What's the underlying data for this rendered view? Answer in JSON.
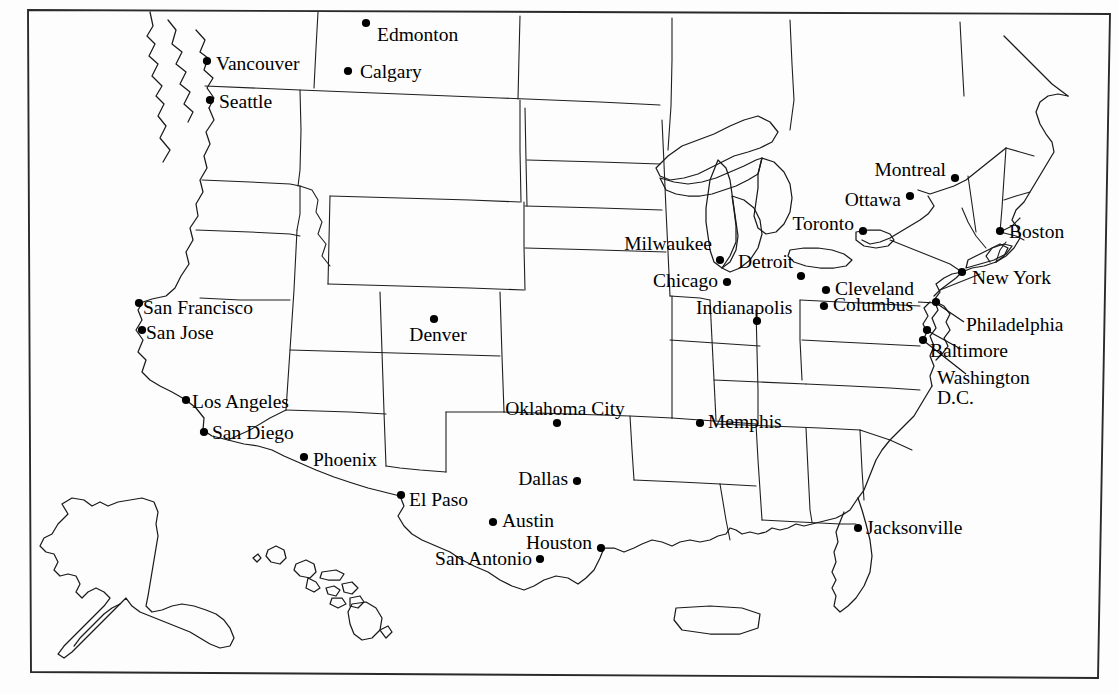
{
  "map": {
    "title": "United States and Canada city reference map",
    "background_color": "#fdfdfd",
    "line_color": "#1a1a1a",
    "dot_color": "#000000",
    "frame": {
      "x1": 28,
      "y1": 10,
      "x2": 1098,
      "y2": 678
    },
    "insets": [
      "alaska",
      "hawaii",
      "puerto-rico"
    ],
    "cities": [
      {
        "name": "Edmonton",
        "label": "Edmonton",
        "dot_x": 366,
        "dot_y": 23,
        "label_x": 377,
        "label_y": 35,
        "anchor": "start"
      },
      {
        "name": "Calgary",
        "label": "Calgary",
        "dot_x": 348,
        "dot_y": 71,
        "label_x": 360,
        "label_y": 72,
        "anchor": "start"
      },
      {
        "name": "Vancouver",
        "label": "Vancouver",
        "dot_x": 207,
        "dot_y": 61,
        "label_x": 216,
        "label_y": 64,
        "anchor": "start"
      },
      {
        "name": "Seattle",
        "label": "Seattle",
        "dot_x": 210,
        "dot_y": 100,
        "label_x": 219,
        "label_y": 102,
        "anchor": "start"
      },
      {
        "name": "Montreal",
        "label": "Montreal",
        "dot_x": 955,
        "dot_y": 178,
        "label_x": 946,
        "label_y": 170,
        "anchor": "end"
      },
      {
        "name": "Ottawa",
        "label": "Ottawa",
        "dot_x": 910,
        "dot_y": 196,
        "label_x": 901,
        "label_y": 200,
        "anchor": "end"
      },
      {
        "name": "Toronto",
        "label": "Toronto",
        "dot_x": 863,
        "dot_y": 231,
        "label_x": 854,
        "label_y": 224,
        "anchor": "end"
      },
      {
        "name": "Boston",
        "label": "Boston",
        "dot_x": 1000,
        "dot_y": 231,
        "label_x": 1009,
        "label_y": 232,
        "anchor": "start"
      },
      {
        "name": "New York",
        "label": "New York",
        "dot_x": 962,
        "dot_y": 272,
        "label_x": 972,
        "label_y": 278,
        "anchor": "start"
      },
      {
        "name": "Milwaukee",
        "label": "Milwaukee",
        "dot_x": 720,
        "dot_y": 260,
        "label_x": 712,
        "label_y": 244,
        "anchor": "end"
      },
      {
        "name": "Chicago",
        "label": "Chicago",
        "dot_x": 727,
        "dot_y": 282,
        "label_x": 718,
        "label_y": 281,
        "anchor": "end"
      },
      {
        "name": "Detroit",
        "label": "Detroit",
        "dot_x": 801,
        "dot_y": 276,
        "label_x": 738,
        "label_y": 262,
        "anchor": "start"
      },
      {
        "name": "Indianapolis",
        "label": "Indianapolis",
        "dot_x": 757,
        "dot_y": 321,
        "label_x": 696,
        "label_y": 308,
        "anchor": "start"
      },
      {
        "name": "Cleveland",
        "label": "Cleveland",
        "dot_x": 826,
        "dot_y": 290,
        "label_x": 835,
        "label_y": 289,
        "anchor": "start"
      },
      {
        "name": "Columbus",
        "label": "Columbus",
        "dot_x": 824,
        "dot_y": 306,
        "label_x": 833,
        "label_y": 305,
        "anchor": "start"
      },
      {
        "name": "Philadelphia",
        "label": "Philadelphia",
        "dot_x": 936,
        "dot_y": 302,
        "label_x": 966,
        "label_y": 325,
        "anchor": "start"
      },
      {
        "name": "Baltimore",
        "label": "Baltimore",
        "dot_x": 927,
        "dot_y": 330,
        "label_x": 930,
        "label_y": 351,
        "anchor": "start"
      },
      {
        "name": "Washington D.C.",
        "label": "Washington\nD.C.",
        "dot_x": 923,
        "dot_y": 340,
        "label_x": 937,
        "label_y": 388,
        "anchor": "start"
      },
      {
        "name": "San Francisco",
        "label": "San Francisco",
        "dot_x": 139,
        "dot_y": 303,
        "label_x": 143,
        "label_y": 308,
        "anchor": "start"
      },
      {
        "name": "San Jose",
        "label": "San Jose",
        "dot_x": 142,
        "dot_y": 330,
        "label_x": 146,
        "label_y": 333,
        "anchor": "start"
      },
      {
        "name": "Denver",
        "label": "Denver",
        "dot_x": 434,
        "dot_y": 319,
        "label_x": 438,
        "label_y": 335,
        "anchor": "mid"
      },
      {
        "name": "Los Angeles",
        "label": "Los Angeles",
        "dot_x": 186,
        "dot_y": 400,
        "label_x": 192,
        "label_y": 402,
        "anchor": "start"
      },
      {
        "name": "San Diego",
        "label": "San Diego",
        "dot_x": 204,
        "dot_y": 432,
        "label_x": 212,
        "label_y": 433,
        "anchor": "start"
      },
      {
        "name": "Phoenix",
        "label": "Phoenix",
        "dot_x": 304,
        "dot_y": 457,
        "label_x": 313,
        "label_y": 460,
        "anchor": "start"
      },
      {
        "name": "El Paso",
        "label": "El Paso",
        "dot_x": 401,
        "dot_y": 495,
        "label_x": 409,
        "label_y": 500,
        "anchor": "start"
      },
      {
        "name": "Oklahoma City",
        "label": "Oklahoma City",
        "dot_x": 557,
        "dot_y": 423,
        "label_x": 565,
        "label_y": 409,
        "anchor": "mid"
      },
      {
        "name": "Dallas",
        "label": "Dallas",
        "dot_x": 577,
        "dot_y": 481,
        "label_x": 568,
        "label_y": 479,
        "anchor": "end"
      },
      {
        "name": "Austin",
        "label": "Austin",
        "dot_x": 493,
        "dot_y": 522,
        "label_x": 502,
        "label_y": 521,
        "anchor": "start"
      },
      {
        "name": "Houston",
        "label": "Houston",
        "dot_x": 601,
        "dot_y": 548,
        "label_x": 592,
        "label_y": 543,
        "anchor": "end"
      },
      {
        "name": "San Antonio",
        "label": "San Antonio",
        "dot_x": 540,
        "dot_y": 559,
        "label_x": 532,
        "label_y": 559,
        "anchor": "end"
      },
      {
        "name": "Memphis",
        "label": "Memphis",
        "dot_x": 700,
        "dot_y": 423,
        "label_x": 708,
        "label_y": 422,
        "anchor": "start"
      },
      {
        "name": "Jacksonville",
        "label": "Jacksonville",
        "dot_x": 858,
        "dot_y": 528,
        "label_x": 866,
        "label_y": 528,
        "anchor": "start"
      }
    ]
  }
}
